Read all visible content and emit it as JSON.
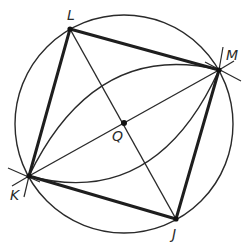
{
  "diagram": {
    "colors": {
      "stroke": "#222222",
      "thin_stroke": "#2a2a2a",
      "background": "#ffffff"
    },
    "circle": {
      "cx": 124,
      "cy": 124,
      "r": 109
    },
    "points": {
      "L": {
        "label": "L",
        "x": 70,
        "y": 29
      },
      "M": {
        "label": "M",
        "x": 219,
        "y": 70
      },
      "J": {
        "label": "J",
        "x": 176,
        "y": 219
      },
      "K": {
        "label": "K",
        "x": 29,
        "y": 176
      },
      "Q": {
        "label": "Q",
        "x": 124,
        "y": 123
      }
    },
    "labels": {
      "L": "L",
      "M": "M",
      "J": "J",
      "K": "K",
      "Q": "Q"
    },
    "segments": {
      "sides": [
        "LM",
        "MJ",
        "JK",
        "KL"
      ],
      "diagonals": [
        "LJ",
        "KM"
      ]
    },
    "arcs": [
      "upper arc K→M",
      "lower arc K→M"
    ]
  }
}
